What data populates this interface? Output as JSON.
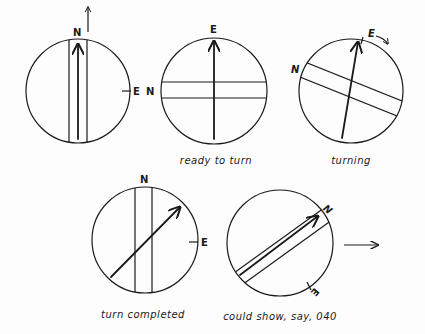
{
  "diagram": {
    "panels": [
      {
        "id": "start",
        "north_label": "N",
        "east_label": "E",
        "caption": ""
      },
      {
        "id": "ready",
        "north_label": "N",
        "east_label": "E",
        "caption": "ready to turn"
      },
      {
        "id": "turning",
        "north_label": "N",
        "east_label": "E",
        "caption": "turning"
      },
      {
        "id": "completed",
        "north_label": "N",
        "east_label": "E",
        "caption": "turn completed"
      },
      {
        "id": "bearing",
        "north_label": "N",
        "east_label": "E",
        "caption": "could show, say, 040"
      }
    ],
    "colors": {
      "ink": "#1a1a1a",
      "background": "#fdfdfd"
    }
  }
}
